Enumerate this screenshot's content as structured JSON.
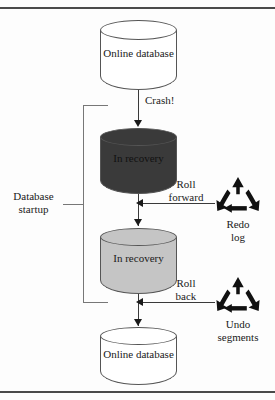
{
  "diagram": {
    "colors": {
      "online_db_fill": "#ffffff",
      "in_recovery_dark_fill": "#3a3a3a",
      "in_recovery_light_fill": "#c5c5c5",
      "stroke": "#555555",
      "icon": "#111111",
      "rule": "#4a4a4a"
    },
    "nodes": [
      {
        "id": "online-db-top",
        "label": "Online\ndatabase",
        "shape": "cylinder",
        "fill": "#ffffff"
      },
      {
        "id": "in-recovery-dark",
        "label": "In\nrecovery",
        "shape": "cylinder",
        "fill": "#3a3a3a"
      },
      {
        "id": "in-recovery-light",
        "label": "In\nrecovery",
        "shape": "cylinder",
        "fill": "#c5c5c5"
      },
      {
        "id": "online-db-bottom",
        "label": "Online\ndatabase",
        "shape": "cylinder",
        "fill": "#ffffff"
      }
    ],
    "edges": [
      {
        "id": "crash",
        "label": "Crash!",
        "direction": "down"
      },
      {
        "id": "roll-forward",
        "label": "Roll\nforward",
        "direction": "left"
      },
      {
        "id": "roll-back",
        "label": "Roll\nback",
        "direction": "left"
      }
    ],
    "sources": [
      {
        "id": "redo-log",
        "label": "Redo\nlog",
        "icon": "recycle-icon"
      },
      {
        "id": "undo-segments",
        "label": "Undo\nsegments",
        "icon": "recycle-icon"
      }
    ],
    "bracket": {
      "label": "Database\nstartup"
    }
  }
}
